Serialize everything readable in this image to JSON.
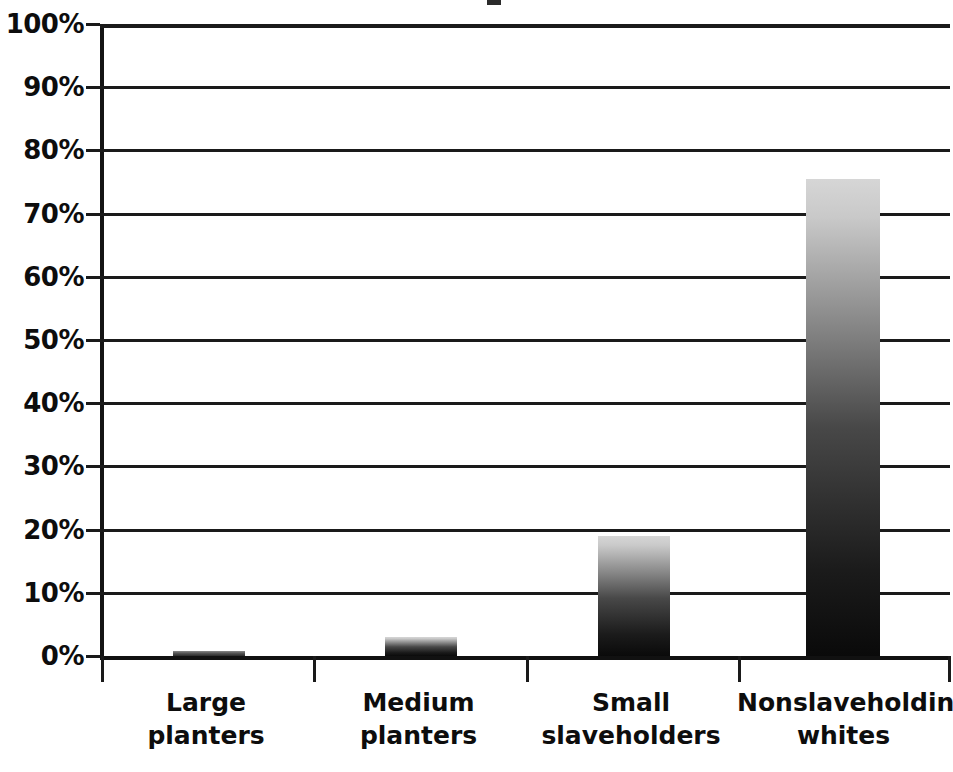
{
  "chart_data": {
    "type": "bar",
    "title": "",
    "subtitle": "",
    "xlabel": "",
    "ylabel": "",
    "categories": [
      "Large planters",
      "Medium planters",
      "Small slaveholders",
      "Nonslaveholding whites"
    ],
    "category_lines": [
      [
        "Large",
        "planters"
      ],
      [
        "Medium",
        "planters"
      ],
      [
        "Small",
        "slaveholders"
      ],
      [
        "Nonslaveholding",
        "whites"
      ]
    ],
    "values": [
      0.8,
      3,
      19,
      75.5
    ],
    "value_labels": [
      "0.8%",
      "3%",
      "19%",
      "75.5%"
    ],
    "ylim": [
      0,
      100
    ],
    "ytick_values": [
      0,
      10,
      20,
      30,
      40,
      50,
      60,
      70,
      80,
      90,
      100
    ],
    "ytick_labels": [
      "0%",
      "10%",
      "20%",
      "30%",
      "40%",
      "50%",
      "60%",
      "70%",
      "80%",
      "90%",
      "100%"
    ],
    "grid": true,
    "grid_axis": "y",
    "legend": false,
    "legend_position": "none",
    "bar_fill": "gradient-dark-to-light",
    "colors": {
      "bar_bottom": "#0a0a0a",
      "bar_top": "#d6d6d6",
      "axis": "#1a1a1a",
      "grid": "#1a1a1a",
      "text": "#0d0d0d",
      "background": "#ffffff"
    }
  }
}
